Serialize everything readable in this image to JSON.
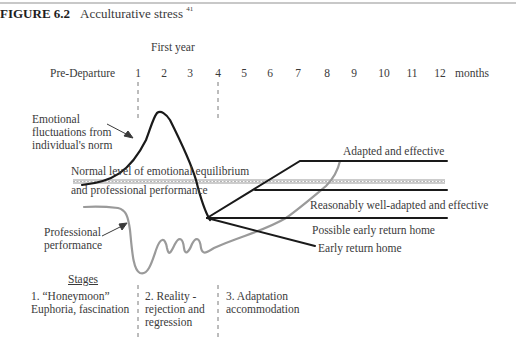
{
  "figure": {
    "number": "FIGURE 6.2",
    "title": "Acculturative stress",
    "footnote_ref": "41"
  },
  "axis": {
    "group_label": "First year",
    "pre_label": "Pre-Departure",
    "months": [
      "1",
      "2",
      "3",
      "4",
      "5",
      "6",
      "7",
      "8",
      "9",
      "10",
      "11",
      "12"
    ],
    "unit_label": "months"
  },
  "labels": {
    "emotional_line1": "Emotional",
    "emotional_line2": "fluctuations from",
    "emotional_line3": "individual's norm",
    "normal_line1": "Normal level of emotional equilibrium",
    "normal_line2": "and professional performance",
    "professional_line1": "Professional",
    "professional_line2": "performance",
    "outcome_adapted": "Adapted and effective",
    "outcome_reasonably": "Reasonably well-adapted and effective",
    "outcome_possible_return": "Possible early return home",
    "outcome_early_return": "Early return home"
  },
  "stages": {
    "heading": "Stages",
    "items": [
      {
        "line1": "1. “Honeymoon”",
        "line2": "Euphoria, fascination",
        "line3": ""
      },
      {
        "line1": "2. Reality -",
        "line2": "rejection and",
        "line3": "regression"
      },
      {
        "line1": "3. Adaptation",
        "line2": "accommodation",
        "line3": ""
      }
    ]
  },
  "colors": {
    "emotion_curve": "#1a1a1a",
    "performance_curve": "#9a9a9a",
    "equilibrium_band": "#8c8c8c",
    "text": "#3a3a3a"
  }
}
